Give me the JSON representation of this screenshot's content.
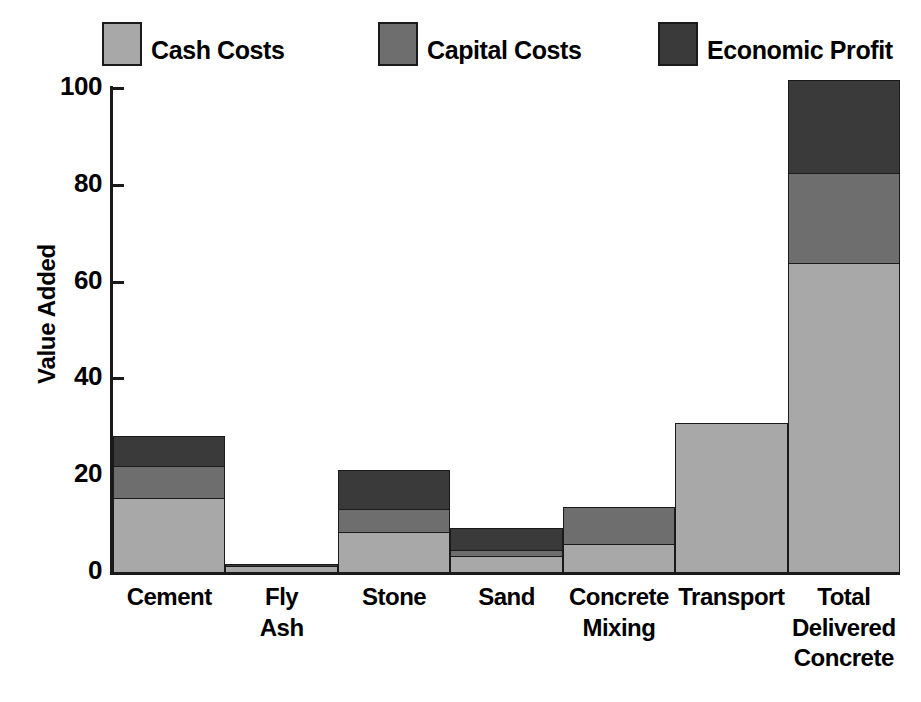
{
  "chart_data": {
    "type": "bar",
    "subtype": "stacked-bar",
    "title": "",
    "xlabel": "",
    "ylabel": "Value Added",
    "ylim": [
      0,
      100
    ],
    "yticks": [
      0,
      20,
      40,
      60,
      80,
      100
    ],
    "grid": false,
    "legend_position": "top",
    "categories": [
      "Cement",
      "Fly Ash",
      "Stone",
      "Sand",
      "Concrete Mixing",
      "Transport",
      "Total Delivered Concrete"
    ],
    "category_lines": [
      [
        "Cement"
      ],
      [
        "Fly",
        "Ash"
      ],
      [
        "Stone"
      ],
      [
        "Sand"
      ],
      [
        "Concrete",
        "Mixing"
      ],
      [
        "Transport"
      ],
      [
        "Total",
        "Delivered",
        "Concrete"
      ]
    ],
    "series": [
      {
        "name": "Cash Costs",
        "color": "#a8a8a8",
        "values": [
          15.5,
          1.5,
          8.5,
          3.5,
          6,
          31,
          64
        ]
      },
      {
        "name": "Capital Costs",
        "color": "#6e6e6e",
        "values": [
          7,
          0,
          5,
          1.5,
          8,
          0,
          19
        ]
      },
      {
        "name": "Economic Profit",
        "color": "#3a3a3a",
        "values": [
          6.5,
          0.7,
          8.5,
          5,
          0,
          0,
          19.5
        ]
      }
    ],
    "totals": [
      29,
      2.2,
      22,
      10,
      14,
      31,
      102.5
    ]
  },
  "legend": {
    "items": [
      {
        "label": "Cash Costs",
        "color": "#a8a8a8",
        "swatch_name": "legend-swatch-cash-costs"
      },
      {
        "label": "Capital Costs",
        "color": "#6e6e6e",
        "swatch_name": "legend-swatch-capital-costs"
      },
      {
        "label": "Economic Profit",
        "color": "#3a3a3a",
        "swatch_name": "legend-swatch-economic-profit"
      }
    ]
  },
  "axes": {
    "y_title": "Value Added",
    "y_tick_labels": [
      "100",
      "80",
      "60",
      "40",
      "20",
      "0"
    ]
  }
}
